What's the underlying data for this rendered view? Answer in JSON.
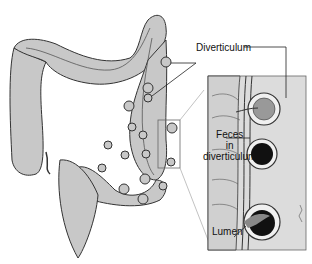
{
  "diagram": {
    "labels": {
      "diverticulum": "Diverticulum",
      "feces_line1": "Feces",
      "feces_line2": "in",
      "feces_line3": "diverticulum",
      "lumen": "Lumen"
    },
    "colors": {
      "tissue_fill": "#c8c8c8",
      "inset_bg": "#dcdcdc",
      "outline": "#333333",
      "feces_fill": "#111111"
    }
  }
}
